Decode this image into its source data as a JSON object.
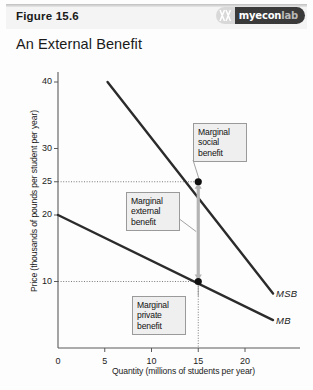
{
  "header": {
    "figure_number": "Figure 15.6",
    "title": "An External Benefit",
    "logo": {
      "name": "myeconlab-logo",
      "text_bold": "myecon",
      "text_dim": "lab"
    }
  },
  "chart_data": {
    "type": "line",
    "title": "An External Benefit",
    "xlabel": "Quantity (millions of students per year)",
    "ylabel": "Price (thousands of pounds per student per year)",
    "xlim": [
      0,
      23.5
    ],
    "ylim": [
      0,
      43
    ],
    "xticks": [
      "0",
      "5",
      "10",
      "15",
      "20"
    ],
    "xtick_values": [
      0,
      5,
      10,
      15,
      20
    ],
    "yticks": [
      "40",
      "30",
      "25",
      "20",
      "10"
    ],
    "ytick_values": [
      40,
      30,
      25,
      20,
      10
    ],
    "grid": false,
    "legend": "inline-curve-labels",
    "series": [
      {
        "name": "MSB",
        "label": "MSB",
        "description": "Marginal social benefit curve",
        "points": [
          [
            5.3,
            40
          ],
          [
            23.0,
            8.2
          ]
        ]
      },
      {
        "name": "MB",
        "label": "MB",
        "description": "Marginal private benefit curve",
        "points": [
          [
            0,
            20
          ],
          [
            23.0,
            4.2
          ]
        ]
      }
    ],
    "markers": [
      {
        "name": "msb-point",
        "x": 15,
        "y": 25
      },
      {
        "name": "mb-point",
        "x": 15,
        "y": 10
      }
    ],
    "dashed_guides": [
      {
        "name": "guide-price-25",
        "orientation": "horizontal",
        "value": 25
      },
      {
        "name": "guide-price-10",
        "orientation": "horizontal",
        "value": 10
      },
      {
        "name": "guide-quantity-15",
        "orientation": "vertical",
        "value": 15
      }
    ],
    "arrow": {
      "name": "marginal-external-benefit-arrow",
      "x": 15,
      "from_y": 10,
      "to_y": 25,
      "double_headed": true
    },
    "annotations": [
      {
        "name": "marginal-social-benefit",
        "text": "Marginal social benefit",
        "lines": [
          "Marginal",
          "social",
          "benefit"
        ],
        "points_to": [
          15,
          25
        ]
      },
      {
        "name": "marginal-external-benefit",
        "text": "Marginal external benefit",
        "lines": [
          "Marginal",
          "external",
          "benefit"
        ],
        "points_to": [
          15,
          17.5
        ]
      },
      {
        "name": "marginal-private-benefit",
        "text": "Marginal private benefit",
        "lines": [
          "Marginal",
          "private",
          "benefit"
        ],
        "points_to": [
          15,
          10
        ]
      }
    ]
  }
}
